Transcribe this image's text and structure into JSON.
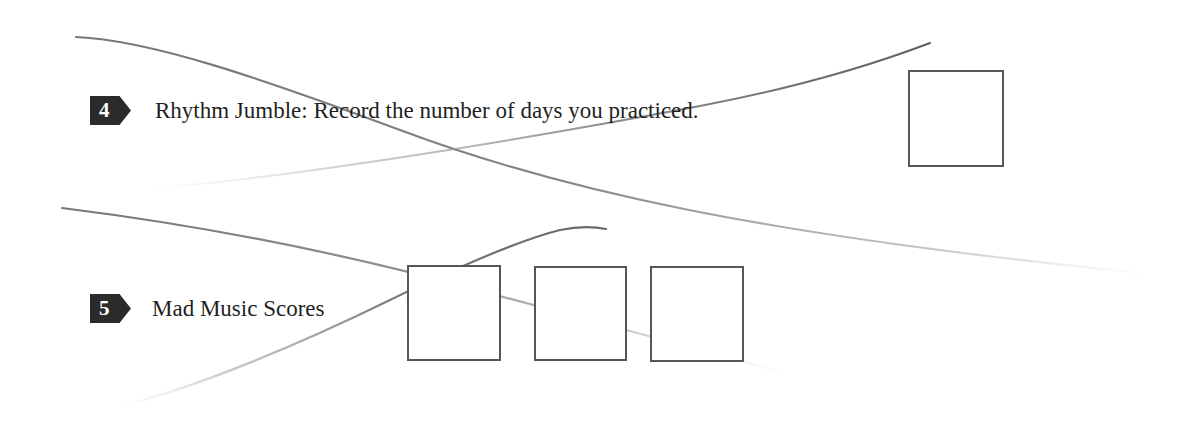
{
  "page": {
    "background_color": "#ffffff",
    "width": 1185,
    "height": 442
  },
  "items": [
    {
      "number": "4",
      "text": "Rhythm Jumble: Record the number of days you practiced.",
      "answer_boxes": 1
    },
    {
      "number": "5",
      "text": "Mad Music Scores",
      "answer_boxes": 3
    }
  ],
  "style": {
    "badge_color": "#2b2b2d",
    "badge_text_color": "#ffffff",
    "text_color": "#1f1f22",
    "box_border_color": "#55555a",
    "artifact_color": "#8a8a90"
  },
  "artifacts": [
    {
      "name": "scan-streak-upper-descending"
    },
    {
      "name": "scan-streak-upper-ascending"
    },
    {
      "name": "scan-streak-lower-descending"
    },
    {
      "name": "scan-streak-lower-ascending"
    }
  ]
}
